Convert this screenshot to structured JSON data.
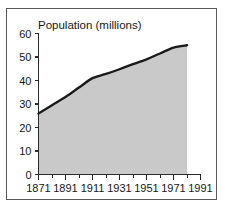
{
  "chart_data": {
    "type": "area",
    "title": "Population (millions)",
    "xlabel": "",
    "ylabel": "Population (millions)",
    "x": [
      1871,
      1881,
      1891,
      1901,
      1911,
      1921,
      1931,
      1941,
      1951,
      1961,
      1971,
      1981
    ],
    "values": [
      26.0,
      29.5,
      33.0,
      37.0,
      41.0,
      42.8,
      44.8,
      47.0,
      49.0,
      51.5,
      54.0,
      55.0
    ],
    "categories": [
      "1871",
      "1881",
      "1891",
      "1901",
      "1911",
      "1921",
      "1931",
      "1941",
      "1951",
      "1961",
      "1971",
      "1981"
    ],
    "xlim": [
      1871,
      1991
    ],
    "ylim": [
      0,
      60
    ],
    "ytick_labels": [
      "0",
      "10",
      "20",
      "30",
      "40",
      "50",
      "60"
    ],
    "yticks": [
      0,
      10,
      20,
      30,
      40,
      50,
      60
    ],
    "xtick_labels": [
      "1871",
      "1891",
      "1911",
      "1931",
      "1951",
      "1971",
      "1991"
    ],
    "xticks": [
      1871,
      1891,
      1911,
      1931,
      1951,
      1971,
      1991
    ],
    "xminor_ticks": [
      1881,
      1901,
      1921,
      1941,
      1961,
      1981
    ],
    "grid": false,
    "legend": "none",
    "fill_color": "#c9c9c9",
    "line_color": "#1a1a1a",
    "axis_color": "#2b2b2b",
    "frame_color": "#5a5a5a",
    "background_color": "#ffffff"
  }
}
